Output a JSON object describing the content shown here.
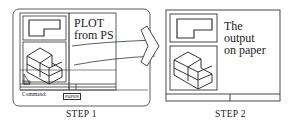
{
  "step1": {
    "label": "STEP 1",
    "annotation_line1": "PLOT",
    "annotation_line2": "from PS",
    "command_label": "Command:",
    "status_button": "PAPER"
  },
  "step2": {
    "label": "STEP 2",
    "annotation_line1": "The",
    "annotation_line2": "output",
    "annotation_line3": "on paper"
  },
  "icons": {
    "arrow": "right-chevron-arrow",
    "ucs": "paperspace-triangle-icon"
  }
}
